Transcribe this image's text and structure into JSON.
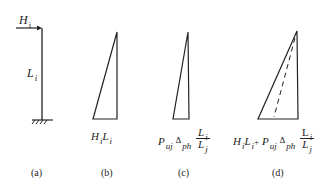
{
  "panels": {
    "a": {
      "caption": "(a)",
      "load_label": "H",
      "load_sub": "i",
      "length_label": "L",
      "length_sub": "i"
    },
    "b": {
      "caption": "(b)",
      "formula": {
        "t1": "H",
        "t1s": "i",
        "t2": "L",
        "t2s": "i"
      }
    },
    "c": {
      "caption": "(c)",
      "formula": {
        "p": "P",
        "ps": "uj",
        "delta": "Δ",
        "ds": "ph",
        "num": "L",
        "num_s": "i",
        "den": "L",
        "den_s": "j"
      }
    },
    "d": {
      "caption": "(d)",
      "formula": {
        "t1": "H",
        "t1s": "i",
        "t2": "L",
        "t2s": "i",
        "plus": "+",
        "p": "P",
        "ps": "uj",
        "delta": "Δ",
        "ds": "ph",
        "num": "L",
        "num_s": "i",
        "den": "L",
        "den_s": "j"
      }
    }
  },
  "colors": {
    "stroke": "#222222",
    "background": "#ffffff"
  }
}
